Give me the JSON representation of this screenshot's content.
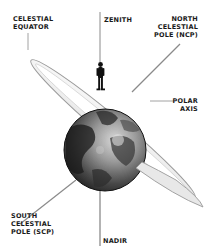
{
  "diagram": {
    "labels": {
      "celestial_equator": "CELESTIAL\nEQUATOR",
      "zenith": "ZENITH",
      "ncp": "NORTH\nCELESTIAL\nPOLE (NCP)",
      "polar_axis": "POLAR\nAXIS",
      "scp": "SOUTH\nCELESTIAL\nPOLE (SCP)",
      "nadir": "NADIR"
    },
    "colors": {
      "text": "#1a1a1a",
      "line": "#8a8a8a",
      "ring_fill": "#f2f2f2",
      "ring_edge": "#9a9a9a",
      "globe_dark": "#1e1e1e",
      "globe_light": "#bdbdbd",
      "figure": "#111111"
    }
  }
}
